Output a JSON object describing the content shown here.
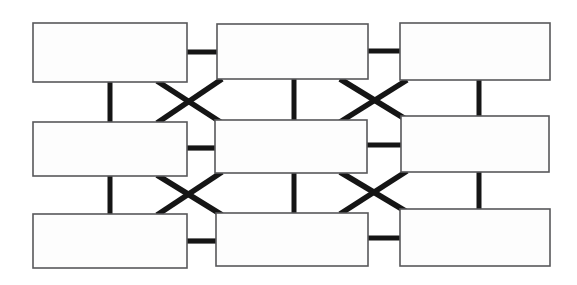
{
  "diagram": {
    "canvas": {
      "width": 577,
      "height": 285,
      "background_color": "#ffffff"
    },
    "style": {
      "node_fill": "#fdfdfd",
      "node_stroke": "#58585a",
      "node_stroke_width": 1.6,
      "link_color": "#151515",
      "link_width_horizontal": 5.2,
      "link_width_vertical": 5.0,
      "link_width_diagonal": 5.6
    },
    "nodes": [
      {
        "id": "r1c1",
        "label": "",
        "row": 1,
        "col": 1,
        "x": 33,
        "y": 23,
        "w": 154,
        "h": 59
      },
      {
        "id": "r1c2",
        "label": "",
        "row": 1,
        "col": 2,
        "x": 217,
        "y": 24,
        "w": 151,
        "h": 55
      },
      {
        "id": "r1c3",
        "label": "",
        "row": 1,
        "col": 3,
        "x": 400,
        "y": 23,
        "w": 150,
        "h": 57
      },
      {
        "id": "r2c1",
        "label": "",
        "row": 2,
        "col": 1,
        "x": 33,
        "y": 122,
        "w": 154,
        "h": 54
      },
      {
        "id": "r2c2",
        "label": "",
        "row": 2,
        "col": 2,
        "x": 215,
        "y": 120,
        "w": 152,
        "h": 53
      },
      {
        "id": "r2c3",
        "label": "",
        "row": 2,
        "col": 3,
        "x": 401,
        "y": 116,
        "w": 148,
        "h": 56
      },
      {
        "id": "r3c1",
        "label": "",
        "row": 3,
        "col": 1,
        "x": 33,
        "y": 214,
        "w": 154,
        "h": 54
      },
      {
        "id": "r3c2",
        "label": "",
        "row": 3,
        "col": 2,
        "x": 216,
        "y": 213,
        "w": 152,
        "h": 53
      },
      {
        "id": "r3c3",
        "label": "",
        "row": 3,
        "col": 3,
        "x": 400,
        "y": 209,
        "w": 150,
        "h": 57
      }
    ],
    "links": [
      {
        "id": "h-r1-c1c2",
        "kind": "horizontal",
        "from": "r1c1",
        "to": "r1c2",
        "x1": 186,
        "y1": 52,
        "x2": 219,
        "y2": 52
      },
      {
        "id": "h-r1-c2c3",
        "kind": "horizontal",
        "from": "r1c2",
        "to": "r1c3",
        "x1": 367,
        "y1": 51,
        "x2": 402,
        "y2": 51
      },
      {
        "id": "h-r2-c1c2",
        "kind": "horizontal",
        "from": "r2c1",
        "to": "r2c2",
        "x1": 186,
        "y1": 148,
        "x2": 217,
        "y2": 148
      },
      {
        "id": "h-r2-c2c3",
        "kind": "horizontal",
        "from": "r2c2",
        "to": "r2c3",
        "x1": 366,
        "y1": 145,
        "x2": 403,
        "y2": 145
      },
      {
        "id": "h-r3-c1c2",
        "kind": "horizontal",
        "from": "r3c1",
        "to": "r3c2",
        "x1": 186,
        "y1": 241,
        "x2": 218,
        "y2": 241
      },
      {
        "id": "h-r3-c2c3",
        "kind": "horizontal",
        "from": "r3c2",
        "to": "r3c3",
        "x1": 367,
        "y1": 238,
        "x2": 402,
        "y2": 238
      },
      {
        "id": "v-c1-r1r2",
        "kind": "vertical",
        "from": "r1c1",
        "to": "r2c1",
        "x1": 110,
        "y1": 81,
        "x2": 110,
        "y2": 123
      },
      {
        "id": "v-c2-r1r2",
        "kind": "vertical",
        "from": "r1c2",
        "to": "r2c2",
        "x1": 294,
        "y1": 78,
        "x2": 294,
        "y2": 121
      },
      {
        "id": "v-c3-r1r2",
        "kind": "vertical",
        "from": "r1c3",
        "to": "r2c3",
        "x1": 479,
        "y1": 79,
        "x2": 479,
        "y2": 117
      },
      {
        "id": "v-c1-r2r3",
        "kind": "vertical",
        "from": "r2c1",
        "to": "r3c1",
        "x1": 110,
        "y1": 175,
        "x2": 110,
        "y2": 215
      },
      {
        "id": "v-c2-r2r3",
        "kind": "vertical",
        "from": "r2c2",
        "to": "r3c2",
        "x1": 294,
        "y1": 172,
        "x2": 294,
        "y2": 214
      },
      {
        "id": "v-c3-r2r3",
        "kind": "vertical",
        "from": "r2c3",
        "to": "r3c3",
        "x1": 479,
        "y1": 171,
        "x2": 479,
        "y2": 210
      },
      {
        "id": "x-left-top-a",
        "kind": "diagonal",
        "from": "r1c1",
        "to": "r2c2",
        "x1": 157,
        "y1": 81,
        "x2": 222,
        "y2": 123
      },
      {
        "id": "x-left-top-b",
        "kind": "diagonal",
        "from": "r1c2",
        "to": "r2c1",
        "x1": 222,
        "y1": 79,
        "x2": 157,
        "y2": 123
      },
      {
        "id": "x-right-top-a",
        "kind": "diagonal",
        "from": "r1c2",
        "to": "r2c3",
        "x1": 340,
        "y1": 79,
        "x2": 407,
        "y2": 120
      },
      {
        "id": "x-right-top-b",
        "kind": "diagonal",
        "from": "r1c3",
        "to": "r2c2",
        "x1": 407,
        "y1": 80,
        "x2": 340,
        "y2": 122
      },
      {
        "id": "x-left-bottom-a",
        "kind": "diagonal",
        "from": "r2c1",
        "to": "r3c2",
        "x1": 157,
        "y1": 175,
        "x2": 222,
        "y2": 215
      },
      {
        "id": "x-left-bottom-b",
        "kind": "diagonal",
        "from": "r2c2",
        "to": "r3c1",
        "x1": 222,
        "y1": 172,
        "x2": 157,
        "y2": 215
      },
      {
        "id": "x-right-bottom-a",
        "kind": "diagonal",
        "from": "r2c2",
        "to": "r3c3",
        "x1": 340,
        "y1": 172,
        "x2": 407,
        "y2": 212
      },
      {
        "id": "x-right-bottom-b",
        "kind": "diagonal",
        "from": "r2c3",
        "to": "r3c2",
        "x1": 407,
        "y1": 171,
        "x2": 340,
        "y2": 214
      }
    ]
  }
}
